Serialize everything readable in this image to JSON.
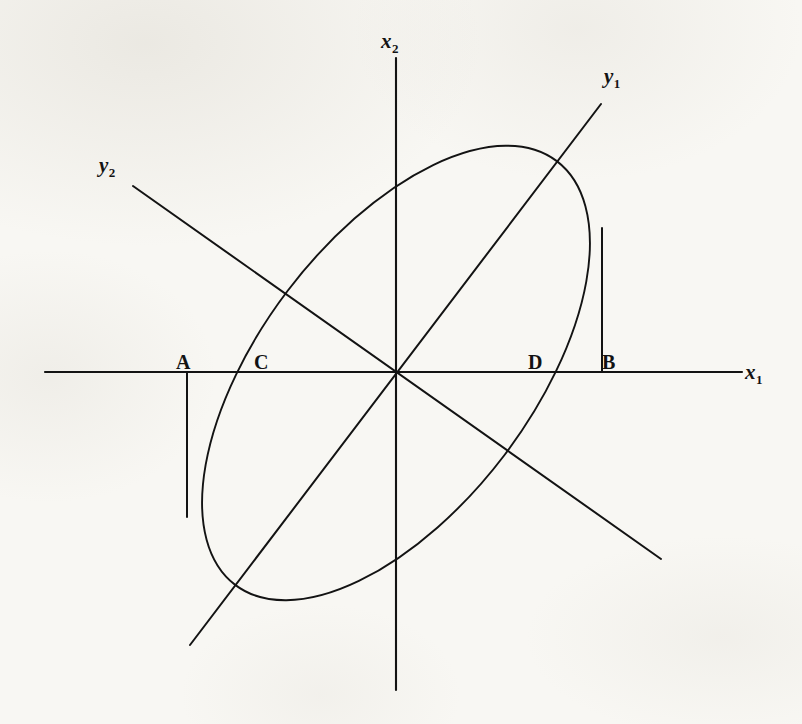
{
  "figure": {
    "kind": "geometry-diagram",
    "background_color": "#f8f7f3",
    "ink_color": "#131313",
    "width": 802,
    "height": 724
  },
  "axes": {
    "x1": {
      "label_main": "x",
      "label_sub": "1",
      "label_x": 745,
      "label_y": 362,
      "line": {
        "x1": 45,
        "y1": 372,
        "x2": 742,
        "y2": 372
      }
    },
    "x2": {
      "label_main": "x",
      "label_sub": "2",
      "label_x": 381,
      "label_y": 31,
      "line": {
        "x1": 396,
        "y1": 58,
        "x2": 396,
        "y2": 690
      }
    },
    "y1": {
      "label_main": "y",
      "label_sub": "1",
      "label_x": 604,
      "label_y": 66,
      "line": {
        "x1": 190,
        "y1": 645,
        "x2": 601,
        "y2": 104
      }
    },
    "y2": {
      "label_main": "y",
      "label_sub": "2",
      "label_x": 99,
      "label_y": 155,
      "line": {
        "x1": 133,
        "y1": 186,
        "x2": 661,
        "y2": 559
      }
    }
  },
  "origin": {
    "x": 396,
    "y": 373
  },
  "ellipse": {
    "center_x": 396,
    "center_y": 373,
    "semi_major": 266,
    "semi_minor": 136,
    "rotation_deg": -52.8
  },
  "points": [
    {
      "id": "A",
      "label": "A",
      "label_x": 176,
      "label_y": 352,
      "axis_x": 187,
      "role": "left-tangent-foot"
    },
    {
      "id": "C",
      "label": "C",
      "label_x": 254,
      "label_y": 352,
      "axis_x": 242,
      "role": "ellipse-x-axis-intersection-left"
    },
    {
      "id": "D",
      "label": "D",
      "label_x": 528,
      "label_y": 352,
      "axis_x": 551,
      "role": "ellipse-x-axis-intersection-right"
    },
    {
      "id": "B",
      "label": "B",
      "label_x": 602,
      "label_y": 352,
      "axis_x": 602,
      "role": "right-tangent-foot"
    }
  ],
  "tangent_segments": [
    {
      "name": "tangent-at-A",
      "x1": 187,
      "y1": 372,
      "x2": 187,
      "y2": 517
    },
    {
      "name": "tangent-at-B",
      "x1": 602,
      "y1": 228,
      "x2": 602,
      "y2": 372
    }
  ]
}
